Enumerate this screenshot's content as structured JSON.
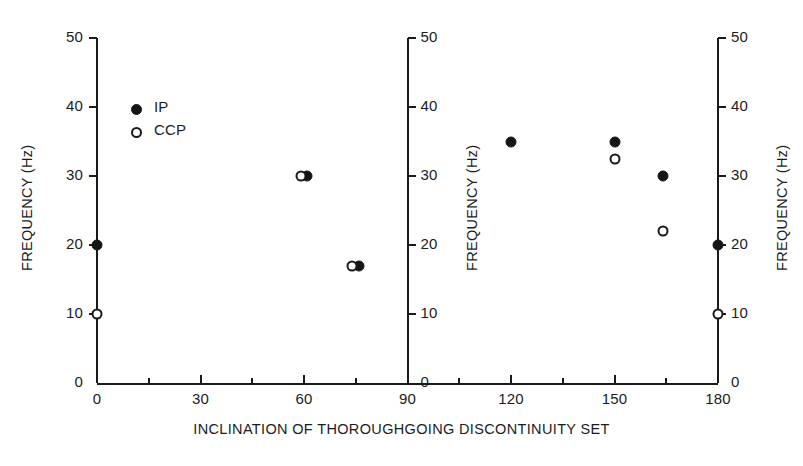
{
  "chart_data": {
    "type": "scatter",
    "title": "",
    "subtitle": "",
    "xlabel": "INCLINATION OF THOROUGHGOING DISCONTINUITY SET",
    "ylabel": "FREQUENCY (Hz)",
    "xlim": [
      0,
      180
    ],
    "ylim": [
      0,
      50
    ],
    "xticks": [
      0,
      30,
      60,
      90,
      120,
      150,
      180
    ],
    "xtick_labels": [
      "0",
      "30",
      "60",
      "90",
      "120",
      "150",
      "180"
    ],
    "yticks": [
      0,
      10,
      20,
      30,
      40,
      50
    ],
    "ytick_labels": [
      "0",
      "10",
      "20",
      "30",
      "40",
      "50"
    ],
    "grid": false,
    "legend_position": "upper-left-inside",
    "y_axes": [
      {
        "name": "left-axis",
        "at_x": 0,
        "label": "FREQUENCY (Hz)",
        "label_side": "left",
        "ticks_side": "left"
      },
      {
        "name": "middle-axis",
        "at_x": 90,
        "label": "FREQUENCY (Hz)",
        "label_side": "right",
        "ticks_side": "right"
      },
      {
        "name": "right-axis",
        "at_x": 180,
        "label": "FREQUENCY (Hz)",
        "label_side": "right",
        "ticks_side": "right"
      }
    ],
    "series": [
      {
        "name": "IP",
        "marker": "filled-circle",
        "color": "#151515",
        "points": [
          {
            "x": 0,
            "y": 20
          },
          {
            "x": 61,
            "y": 30
          },
          {
            "x": 76,
            "y": 17
          },
          {
            "x": 120,
            "y": 35
          },
          {
            "x": 150,
            "y": 35
          },
          {
            "x": 164,
            "y": 30
          },
          {
            "x": 180,
            "y": 20
          }
        ]
      },
      {
        "name": "CCP",
        "marker": "open-circle",
        "color": "#1a1a1a",
        "points": [
          {
            "x": 0,
            "y": 10
          },
          {
            "x": 59,
            "y": 30
          },
          {
            "x": 74,
            "y": 17
          },
          {
            "x": 150,
            "y": 32.5
          },
          {
            "x": 164,
            "y": 22
          },
          {
            "x": 180,
            "y": 10
          }
        ]
      }
    ]
  },
  "legend": {
    "entries": [
      {
        "label": "IP",
        "marker": "filled-circle"
      },
      {
        "label": "CCP",
        "marker": "open-circle"
      }
    ]
  }
}
